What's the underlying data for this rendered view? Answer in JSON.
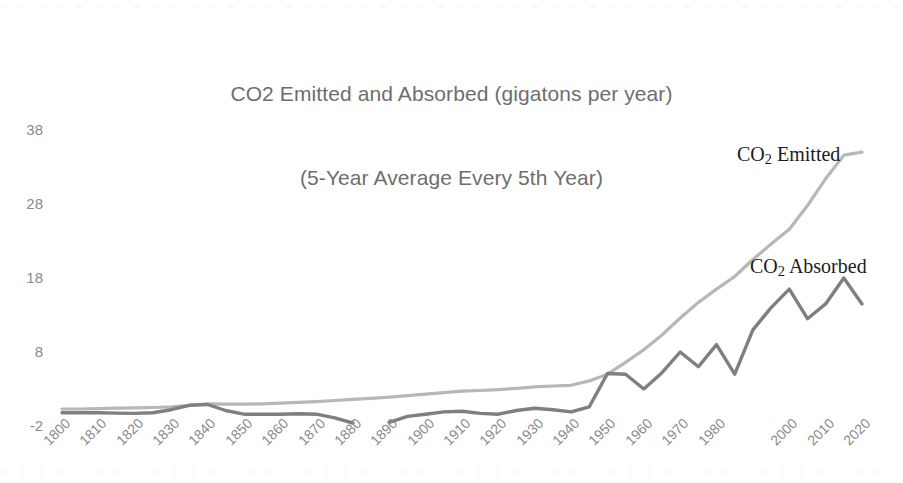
{
  "chart_data": {
    "type": "line",
    "title": "CO2 Emitted and Absorbed (gigatons per year)",
    "subtitle": "(5-Year Average Every 5th Year)",
    "title_line1": "CO2 Emitted and Absorbed (gigatons per year)",
    "title_line2": "(5-Year Average Every 5th Year)",
    "xlabel": "",
    "ylabel": "",
    "ylim": [
      -2,
      38
    ],
    "xlim": [
      1800,
      2020
    ],
    "grid": false,
    "legend_position": "inline-right",
    "y_ticks": [
      "38",
      "28",
      "18",
      "8",
      "-2"
    ],
    "y_tick_values": [
      38,
      28,
      18,
      8,
      -2
    ],
    "x_ticks": [
      "1800",
      "1810",
      "1820",
      "1830",
      "1840",
      "1850",
      "1860",
      "1870",
      "1880",
      "1890",
      "1900",
      "1910",
      "1920",
      "1930",
      "1940",
      "1950",
      "1960",
      "1970",
      "1980",
      "2000",
      "2010",
      "2020"
    ],
    "x_tick_values": [
      1800,
      1810,
      1820,
      1830,
      1840,
      1850,
      1860,
      1870,
      1880,
      1890,
      1900,
      1910,
      1920,
      1930,
      1940,
      1950,
      1960,
      1970,
      1980,
      2000,
      2010,
      2020
    ],
    "x": [
      1800,
      1805,
      1810,
      1815,
      1820,
      1825,
      1830,
      1835,
      1840,
      1845,
      1850,
      1855,
      1860,
      1865,
      1870,
      1875,
      1880,
      1885,
      1890,
      1895,
      1900,
      1905,
      1910,
      1915,
      1920,
      1925,
      1930,
      1935,
      1940,
      1945,
      1950,
      1955,
      1960,
      1965,
      1970,
      1975,
      1980,
      1985,
      1990,
      1995,
      2000,
      2005,
      2010,
      2015,
      2020
    ],
    "series": [
      {
        "name": "CO2 Emitted",
        "label": "CO₂ Emitted",
        "color": "#b7b7b7",
        "values": [
          0.3,
          0.3,
          0.35,
          0.4,
          0.45,
          0.5,
          0.6,
          0.8,
          1.0,
          0.95,
          0.95,
          1.0,
          1.1,
          1.2,
          1.3,
          1.45,
          1.6,
          1.75,
          1.9,
          2.1,
          2.3,
          2.5,
          2.7,
          2.8,
          2.9,
          3.1,
          3.3,
          3.4,
          3.5,
          4.1,
          5.0,
          6.6,
          8.3,
          10.3,
          12.6,
          14.7,
          16.5,
          18.2,
          20.5,
          22.6,
          24.6,
          27.8,
          31.4,
          34.6,
          35.0
        ]
      },
      {
        "name": "CO2 Absorbed",
        "label": "CO₂ Absorbed",
        "color": "#7f7f7f",
        "values": [
          -0.2,
          -0.2,
          -0.2,
          -0.25,
          -0.3,
          -0.2,
          0.2,
          0.8,
          0.9,
          0.1,
          -0.4,
          -0.4,
          -0.4,
          -0.35,
          -0.4,
          -0.9,
          -1.6,
          null,
          -1.5,
          -0.7,
          -0.4,
          -0.1,
          0.0,
          -0.3,
          -0.4,
          0.1,
          0.4,
          0.2,
          -0.1,
          0.6,
          5.1,
          5.0,
          3.0,
          5.2,
          8.0,
          6.0,
          9.0,
          5.0,
          11.0,
          14.0,
          16.5,
          12.5,
          14.5,
          18.0,
          14.5
        ]
      }
    ],
    "annotations": [
      {
        "text": "CO₂ Emitted",
        "x_px": 737,
        "y_px": 143
      },
      {
        "text": "CO₂ Absorbed",
        "x_px": 750,
        "y_px": 255
      }
    ]
  }
}
